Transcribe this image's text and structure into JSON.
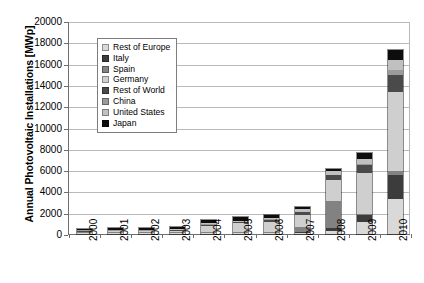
{
  "chart_data": {
    "type": "bar",
    "stacked": true,
    "title": "",
    "xlabel": "",
    "ylabel": "Annual Photovoltaic Installations [MWp]",
    "ylim": [
      0,
      20000
    ],
    "ytick_step": 2000,
    "ytick_labels": [
      "20000",
      "18000",
      "16000",
      "14000",
      "12000",
      "10000",
      "8000",
      "6000",
      "4000",
      "2000",
      "0"
    ],
    "grid": true,
    "legend_position": "upper-left-inside",
    "categories": [
      "2000",
      "2001",
      "2002",
      "2003",
      "2004",
      "2005",
      "2006",
      "2007",
      "2008",
      "2009",
      "2010"
    ],
    "series": [
      {
        "name": "Japan",
        "color": "#0d0d0d",
        "values": [
          110,
          120,
          140,
          180,
          270,
          290,
          290,
          210,
          230,
          480,
          990
        ]
      },
      {
        "name": "United States",
        "color": "#c0c0c0",
        "values": [
          20,
          30,
          45,
          60,
          100,
          105,
          145,
          210,
          340,
          480,
          900
        ]
      },
      {
        "name": "China",
        "color": "#9a9a9a",
        "values": [
          3,
          5,
          8,
          10,
          10,
          10,
          10,
          20,
          45,
          160,
          520
        ]
      },
      {
        "name": "Rest of World",
        "color": "#4a4a4a",
        "values": [
          25,
          30,
          40,
          55,
          90,
          110,
          160,
          240,
          430,
          760,
          1560
        ]
      },
      {
        "name": "Germany",
        "color": "#cfcfcf",
        "values": [
          44,
          80,
          80,
          145,
          600,
          830,
          960,
          1100,
          1950,
          3800,
          7400
        ]
      },
      {
        "name": "Spain",
        "color": "#828282",
        "values": [
          2,
          3,
          5,
          10,
          10,
          20,
          90,
          560,
          2600,
          70,
          370
        ]
      },
      {
        "name": "Italy",
        "color": "#3c3c3c",
        "values": [
          2,
          3,
          4,
          5,
          8,
          10,
          12,
          40,
          260,
          720,
          2320
        ]
      },
      {
        "name": "Rest of Europe",
        "color": "#d9d9d9",
        "values": [
          5,
          8,
          12,
          18,
          25,
          35,
          55,
          90,
          260,
          1100,
          3250
        ]
      }
    ],
    "totals": [
      211,
      279,
      334,
      483,
      1113,
      1410,
      1722,
      2470,
      6115,
      7570,
      17310
    ]
  },
  "legend": {
    "items": [
      {
        "label": "Rest of Europe",
        "color": "#d9d9d9"
      },
      {
        "label": "Italy",
        "color": "#3c3c3c"
      },
      {
        "label": "Spain",
        "color": "#828282"
      },
      {
        "label": "Germany",
        "color": "#cfcfcf"
      },
      {
        "label": "Rest of World",
        "color": "#4a4a4a"
      },
      {
        "label": "China",
        "color": "#9a9a9a"
      },
      {
        "label": "United States",
        "color": "#c0c0c0"
      },
      {
        "label": "Japan",
        "color": "#0d0d0d"
      }
    ]
  },
  "axes": {
    "y_title": "Annual Photovoltaic Installations [MWp]"
  },
  "colors": {
    "axis": "#6f6f6f",
    "grid": "#b9b9b9",
    "frame": "#b9b9b9",
    "background": "#ffffff",
    "text": "#000000"
  }
}
